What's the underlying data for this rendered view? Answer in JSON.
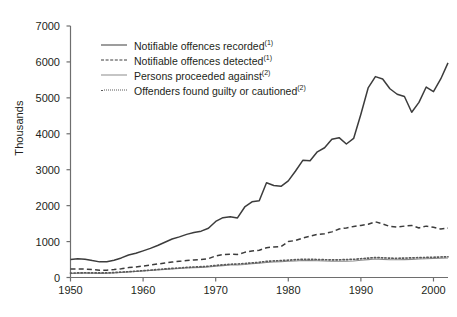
{
  "chart_data": {
    "type": "line",
    "title": "",
    "subtitle": "",
    "xlabel": "",
    "ylabel": "Thousands",
    "xlim": [
      1950,
      2002
    ],
    "ylim": [
      0,
      7000
    ],
    "grid": false,
    "legend_position": "top-left-inside",
    "xticks": [
      1950,
      1960,
      1970,
      1980,
      1990,
      2000
    ],
    "xticklabels": [
      "1950",
      "1960",
      "1970",
      "1980",
      "1990",
      "2000"
    ],
    "yticks": [
      0,
      1000,
      2000,
      3000,
      4000,
      5000,
      6000,
      7000
    ],
    "yticklabels": [
      "0",
      "1000",
      "2000",
      "3000",
      "4000",
      "5000",
      "6000",
      "7000"
    ],
    "x": [
      1950,
      1951,
      1952,
      1953,
      1954,
      1955,
      1956,
      1957,
      1958,
      1959,
      1960,
      1961,
      1962,
      1963,
      1964,
      1965,
      1966,
      1967,
      1968,
      1969,
      1970,
      1971,
      1972,
      1973,
      1974,
      1975,
      1976,
      1977,
      1978,
      1979,
      1980,
      1981,
      1982,
      1983,
      1984,
      1985,
      1986,
      1987,
      1988,
      1989,
      1990,
      1991,
      1992,
      1993,
      1994,
      1995,
      1996,
      1997,
      1998,
      1999,
      2000,
      2001,
      2002
    ],
    "series": [
      {
        "name": "Notifiable offences recorded",
        "footnote": "(1)",
        "style": "solid",
        "color": "#3c3c3c",
        "values": [
          500,
          525,
          510,
          470,
          435,
          440,
          480,
          545,
          625,
          675,
          740,
          810,
          890,
          980,
          1070,
          1130,
          1200,
          1250,
          1290,
          1370,
          1560,
          1666,
          1690,
          1658,
          1963,
          2106,
          2136,
          2636,
          2562,
          2537,
          2688,
          2964,
          3262,
          3247,
          3499,
          3612,
          3847,
          3892,
          3716,
          3870,
          4544,
          5276,
          5592,
          5526,
          5253,
          5100,
          5036,
          4599,
          4874,
          5301,
          5171,
          5525,
          5975
        ]
      },
      {
        "name": "Notifiable offences detected",
        "footnote": "(1)",
        "style": "dashed",
        "color": "#3c3c3c",
        "values": [
          235,
          240,
          235,
          220,
          205,
          205,
          220,
          245,
          275,
          290,
          320,
          345,
          375,
          405,
          430,
          450,
          470,
          490,
          500,
          525,
          600,
          640,
          650,
          640,
          700,
          740,
          760,
          830,
          850,
          860,
          1000,
          1030,
          1100,
          1150,
          1200,
          1220,
          1270,
          1350,
          1380,
          1420,
          1450,
          1480,
          1550,
          1490,
          1420,
          1400,
          1430,
          1450,
          1380,
          1430,
          1400,
          1350,
          1375
        ]
      },
      {
        "name": "Persons proceeded against",
        "footnote": "(2)",
        "style": "solid-grey",
        "color": "#8b8b8b",
        "values": [
          110,
          118,
          122,
          120,
          115,
          118,
          128,
          140,
          152,
          165,
          178,
          192,
          208,
          222,
          236,
          248,
          262,
          274,
          282,
          295,
          315,
          330,
          345,
          350,
          362,
          380,
          395,
          420,
          432,
          440,
          450,
          462,
          472,
          470,
          465,
          458,
          452,
          450,
          455,
          462,
          480,
          498,
          512,
          505,
          495,
          492,
          498,
          505,
          512,
          520,
          528,
          535,
          545
        ]
      },
      {
        "name": "Offenders found guilty or cautioned",
        "footnote": "(2)",
        "style": "dotted",
        "color": "#5a5a5a",
        "values": [
          120,
          128,
          132,
          130,
          126,
          128,
          138,
          150,
          162,
          176,
          190,
          205,
          222,
          238,
          252,
          265,
          280,
          292,
          300,
          314,
          336,
          352,
          368,
          374,
          388,
          406,
          422,
          448,
          460,
          470,
          482,
          496,
          508,
          506,
          500,
          495,
          490,
          492,
          498,
          506,
          522,
          540,
          556,
          548,
          538,
          534,
          540,
          546,
          552,
          558,
          564,
          570,
          578
        ]
      }
    ]
  },
  "axes": {
    "y_title": "Thousands"
  },
  "legend": {
    "items": [
      {
        "label": "Notifiable offences recorded",
        "note": "(1)",
        "sample": "solid-line-sample"
      },
      {
        "label": "Notifiable offences detected",
        "note": "(1)",
        "sample": "dashed-line-sample"
      },
      {
        "label": "Persons proceeded against",
        "note": "(2)",
        "sample": "grey-line-sample"
      },
      {
        "label": "Offenders found guilty or cautioned",
        "note": "(2)",
        "sample": "dotted-line-sample"
      }
    ]
  }
}
